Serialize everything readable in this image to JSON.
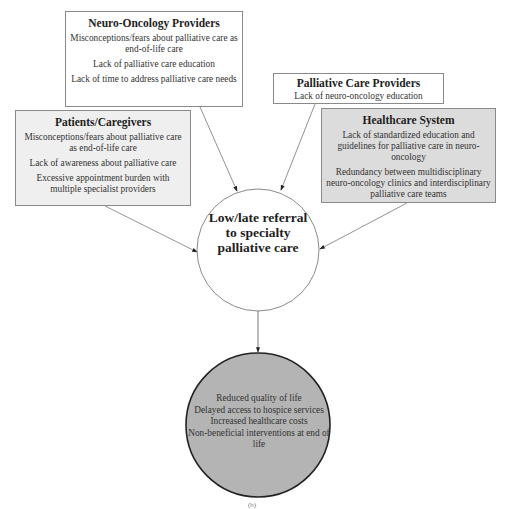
{
  "diagram": {
    "boxes": {
      "neuro_oncology": {
        "title": "Neuro-Oncology Providers",
        "items": [
          "Misconceptions/fears about palliative care as end-of-life care",
          "Lack of palliative care education",
          "Lack of time to address palliative care needs"
        ]
      },
      "palliative_care": {
        "title": "Palliative Care Providers",
        "items": [
          "Lack of neuro-oncology education"
        ]
      },
      "patients_caregivers": {
        "title": "Patients/Caregivers",
        "items": [
          "Misconceptions/fears about palliative care as end-of-life care",
          "Lack of awareness about palliative care",
          "Excessive appointment burden with multiple specialist providers"
        ]
      },
      "healthcare_system": {
        "title": "Healthcare System",
        "items": [
          "Lack of standardized education and guidelines for palliative care in neuro-oncology",
          "Redundancy between multidisciplinary neuro-oncology clinics and interdisciplinary palliative care teams"
        ]
      }
    },
    "center": {
      "label": "Low/late referral to specialty palliative care"
    },
    "outcomes": {
      "items": [
        "Reduced quality of life",
        "Delayed access to hospice services",
        "Increased healthcare costs",
        "Non-beneficial interventions at end of life"
      ]
    },
    "footnote": "(b)",
    "colors": {
      "white_box": "#ffffff",
      "patients_fill": "#efefef",
      "healthcare_fill": "#dcdcdc",
      "outcome_fill": "#b4b4b4",
      "border": "#8a8a8a"
    }
  }
}
